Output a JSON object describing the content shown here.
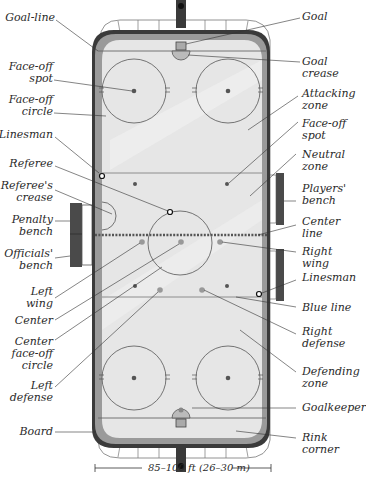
{
  "diagram": {
    "scale_label": "85–100 ft (26–30 m)",
    "colors": {
      "ice": "#e6e6e6",
      "board": "#3a3a3a",
      "inner_board": "#9a9a9a",
      "lines": "#555555",
      "bench": "#4a4a4a",
      "text": "#2a2a2a"
    },
    "labels_left": [
      {
        "id": "goal-line",
        "text": "Goal-line"
      },
      {
        "id": "face-off-spot-left",
        "text": "Face-off\nspot"
      },
      {
        "id": "face-off-circle",
        "text": "Face-off\ncircle"
      },
      {
        "id": "linesman-left",
        "text": "Linesman"
      },
      {
        "id": "referee",
        "text": "Referee"
      },
      {
        "id": "referees-crease",
        "text": "Referee's\ncrease"
      },
      {
        "id": "penalty-bench",
        "text": "Penalty\nbench"
      },
      {
        "id": "officials-bench",
        "text": "Officials'\nbench"
      },
      {
        "id": "left-wing",
        "text": "Left\nwing"
      },
      {
        "id": "center",
        "text": "Center"
      },
      {
        "id": "center-face-off-circle",
        "text": "Center\nface-off\ncircle"
      },
      {
        "id": "left-defense",
        "text": "Left\ndefense"
      },
      {
        "id": "board",
        "text": "Board"
      }
    ],
    "labels_right": [
      {
        "id": "goal",
        "text": "Goal"
      },
      {
        "id": "goal-crease",
        "text": "Goal\ncrease"
      },
      {
        "id": "attacking-zone",
        "text": "Attacking\nzone"
      },
      {
        "id": "face-off-spot-right",
        "text": "Face-off\nspot"
      },
      {
        "id": "neutral-zone",
        "text": "Neutral\nzone"
      },
      {
        "id": "players-bench",
        "text": "Players'\nbench"
      },
      {
        "id": "center-line",
        "text": "Center line"
      },
      {
        "id": "right-wing",
        "text": "Right wing"
      },
      {
        "id": "linesman-right",
        "text": "Linesman"
      },
      {
        "id": "blue-line",
        "text": "Blue line"
      },
      {
        "id": "right-defense",
        "text": "Right\ndefense"
      },
      {
        "id": "defending-zone",
        "text": "Defending\nzone"
      },
      {
        "id": "goalkeeper",
        "text": "Goalkeeper"
      },
      {
        "id": "rink-corner",
        "text": "Rink corner"
      }
    ]
  }
}
